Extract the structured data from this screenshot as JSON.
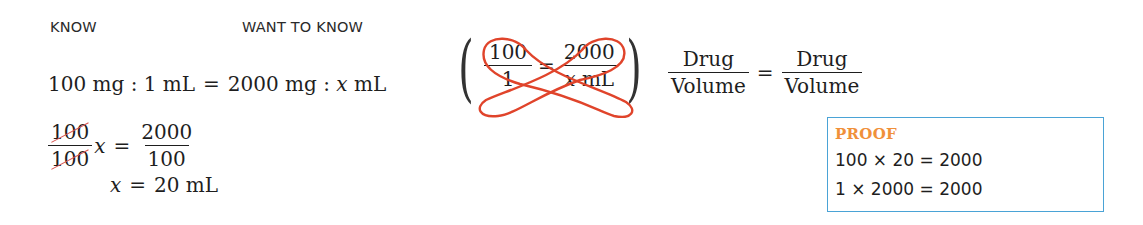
{
  "headers": {
    "know": "KNOW",
    "want_to_know": "WANT TO KNOW"
  },
  "ratio_line": {
    "left": "100 mg : 1 mL",
    "equals": "=",
    "right_prefix": "2000 mg : ",
    "right_var": "x",
    "right_unit": " mL"
  },
  "solve_step": {
    "lhs_num": "100",
    "lhs_den": "100",
    "var": "x",
    "equals": "=",
    "rhs_num": "2000",
    "rhs_den": "100"
  },
  "result": {
    "var": "x",
    "equals": "=",
    "value": "20 mL"
  },
  "cross_multiply": {
    "left_num": "100",
    "left_den": "1",
    "equals": "=",
    "right_num": "2000",
    "right_den_var": "x",
    "right_den_unit": " mL",
    "loop_color": "#e0442b"
  },
  "formula": {
    "left_num": "Drug",
    "left_den": "Volume",
    "equals": "=",
    "right_num": "Drug",
    "right_den": "Volume"
  },
  "proof": {
    "title": "PROOF",
    "lines": [
      "100 × 20 = 2000",
      "1 × 2000 = 2000"
    ],
    "title_color": "#f0903a",
    "border_color": "#4aa3d6"
  }
}
